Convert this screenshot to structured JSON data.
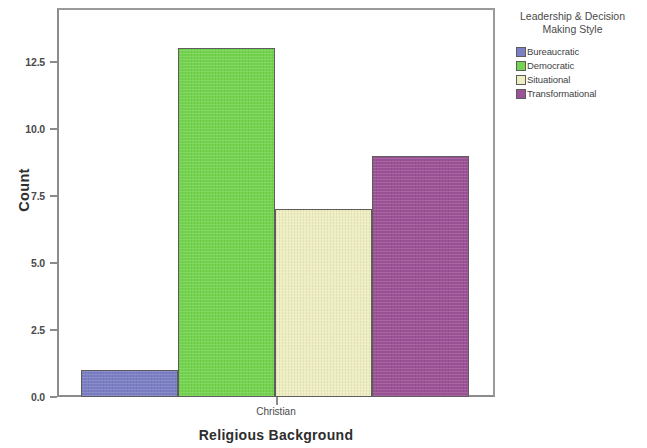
{
  "chart_data": {
    "type": "bar",
    "title": "",
    "xlabel": "Religious Background",
    "ylabel": "Count",
    "categories": [
      "Christian"
    ],
    "legend_title": "Leadership & Decision Making Style",
    "legend_position": "right",
    "grid": false,
    "ylim": [
      0,
      14.5
    ],
    "yticks": [
      "0.0",
      "2.5",
      "5.0",
      "7.5",
      "10.0",
      "12.5"
    ],
    "ytick_values": [
      0,
      2.5,
      5,
      7.5,
      10,
      12.5
    ],
    "series": [
      {
        "name": "Bureaucratic",
        "color": "#7b7fc4",
        "values": [
          1
        ]
      },
      {
        "name": "Democratic",
        "color": "#74d44f",
        "values": [
          13
        ]
      },
      {
        "name": "Situational",
        "color": "#eeeec2",
        "values": [
          7
        ]
      },
      {
        "name": "Transformational",
        "color": "#9c5296",
        "values": [
          9
        ]
      }
    ]
  },
  "axis": {
    "y_title": "Count",
    "x_title": "Religious Background",
    "x_tick_label": "Christian",
    "y_labels": [
      "12.5",
      "10.0",
      "7.5",
      "5.0",
      "2.5",
      "0.0"
    ]
  },
  "legend": {
    "title_line1": "Leadership & Decision",
    "title_line2": "Making Style",
    "entries": [
      {
        "label": "Bureaucratic",
        "color": "#7b7fc4"
      },
      {
        "label": "Democratic",
        "color": "#74d44f"
      },
      {
        "label": "Situational",
        "color": "#eeeec2"
      },
      {
        "label": "Transformational",
        "color": "#9c5296"
      }
    ]
  }
}
